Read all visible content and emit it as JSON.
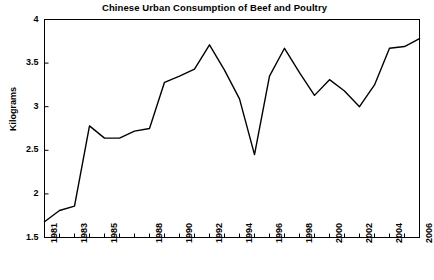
{
  "chart_data": {
    "type": "line",
    "title": "Chinese Urban Consumption of Beef and Poultry",
    "xlabel": "",
    "ylabel": "Kilograms",
    "ylim": [
      1.5,
      4
    ],
    "yticks": [
      1.5,
      2,
      2.5,
      3,
      3.5,
      4
    ],
    "ytick_labels": [
      "1.5",
      "2",
      "2.5",
      "3",
      "3.5",
      "4"
    ],
    "xlim": [
      1981,
      2006
    ],
    "grid": false,
    "legend": null,
    "line_color": "#000000",
    "x": [
      1981,
      1982,
      1983,
      1984,
      1985,
      1986,
      1987,
      1988,
      1989,
      1990,
      1991,
      1992,
      1993,
      1994,
      1995,
      1996,
      1997,
      1998,
      1999,
      2000,
      2001,
      2002,
      2003,
      2004,
      2005,
      2006
    ],
    "categories": [
      "1981",
      "1982",
      "1983",
      "1984",
      "1985",
      "1986",
      "1987",
      "1988",
      "1989",
      "1990",
      "1991",
      "1992",
      "1993",
      "1994",
      "1995",
      "1996",
      "1997",
      "1998",
      "1999",
      "2000",
      "2001",
      "2002",
      "2003",
      "2004",
      "2005",
      "2006"
    ],
    "values": [
      1.68,
      1.81,
      1.86,
      2.78,
      2.64,
      2.64,
      2.72,
      2.75,
      3.28,
      3.35,
      3.43,
      3.71,
      3.42,
      3.09,
      2.45,
      3.35,
      3.67,
      3.39,
      3.13,
      3.31,
      3.18,
      3.0,
      3.25,
      3.67,
      3.69,
      3.78
    ],
    "xtick_labels": [
      {
        "year": 1981,
        "label": "1981"
      },
      {
        "year": 1983,
        "label": "1983"
      },
      {
        "year": 1985,
        "label": "1985"
      },
      {
        "year": 1988,
        "label": "1988"
      },
      {
        "year": 1990,
        "label": "1990"
      },
      {
        "year": 1992,
        "label": "1992"
      },
      {
        "year": 1994,
        "label": "1994"
      },
      {
        "year": 1996,
        "label": "1996"
      },
      {
        "year": 1998,
        "label": "1998"
      },
      {
        "year": 2000,
        "label": "2000"
      },
      {
        "year": 2002,
        "label": "2002"
      },
      {
        "year": 2004,
        "label": "2004"
      },
      {
        "year": 2006,
        "label": "2006"
      }
    ]
  }
}
